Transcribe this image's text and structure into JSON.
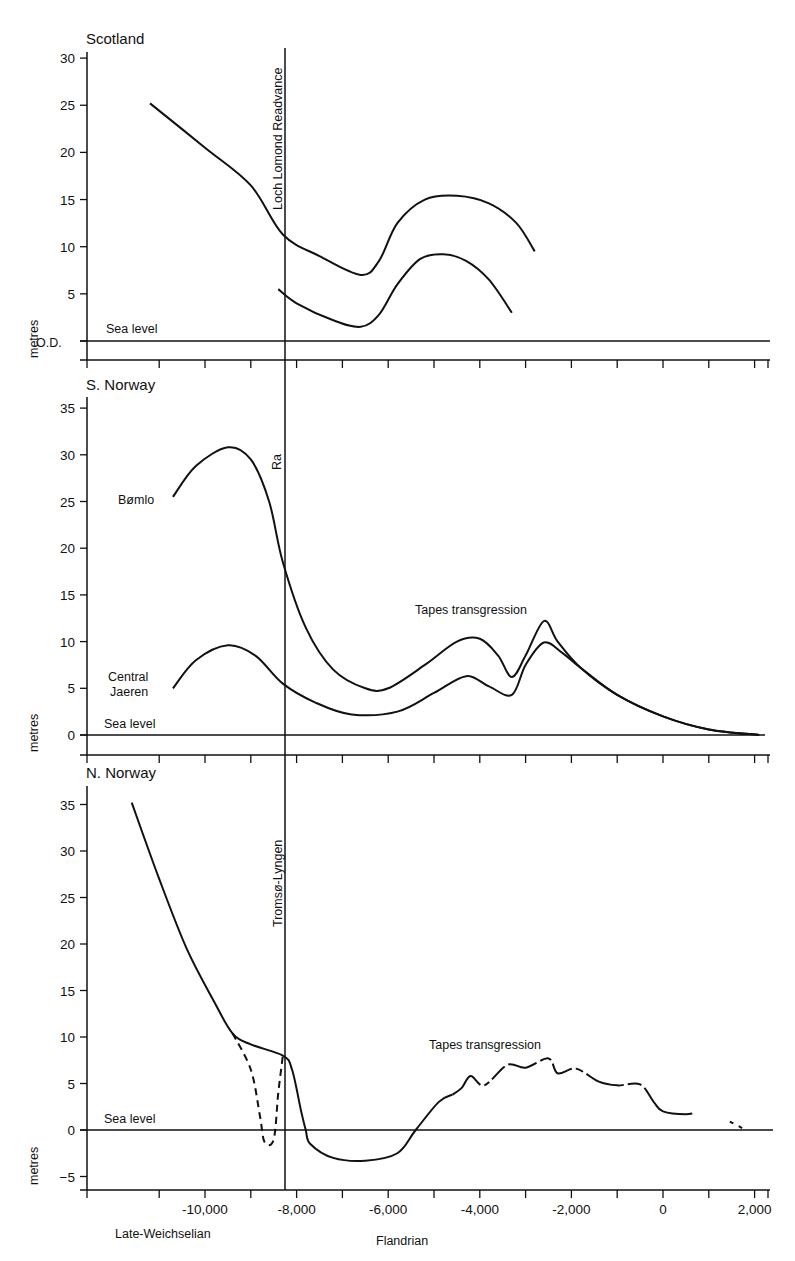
{
  "chart_data": [
    {
      "type": "line",
      "title": "Scotland",
      "ylabel": "metres",
      "ylim": [
        -2,
        31
      ],
      "yticks": [
        {
          "v": 30,
          "label": "30"
        },
        {
          "v": 25,
          "label": "25"
        },
        {
          "v": 20,
          "label": "20"
        },
        {
          "v": 15,
          "label": "15"
        },
        {
          "v": 10,
          "label": "10"
        },
        {
          "v": 5,
          "label": "5"
        },
        {
          "v": 0,
          "label": "O.D."
        }
      ],
      "baseline_label": "Sea level",
      "event_line": {
        "x": -8300,
        "label": "Loch Lomond Readvance"
      },
      "series": [
        {
          "name": "upper curve",
          "style": "solid",
          "points": [
            [
              -11200,
              25.2
            ],
            [
              -10000,
              20.5
            ],
            [
              -9000,
              16.5
            ],
            [
              -8300,
              11.3
            ],
            [
              -7500,
              9.0
            ],
            [
              -6600,
              7.0
            ],
            [
              -6200,
              8.5
            ],
            [
              -5800,
              12.5
            ],
            [
              -5200,
              15.0
            ],
            [
              -4500,
              15.4
            ],
            [
              -3800,
              14.6
            ],
            [
              -3200,
              12.5
            ],
            [
              -2800,
              9.5
            ]
          ]
        },
        {
          "name": "lower curve",
          "style": "solid",
          "points": [
            [
              -8400,
              5.5
            ],
            [
              -8000,
              4.0
            ],
            [
              -7200,
              2.2
            ],
            [
              -6600,
              1.5
            ],
            [
              -6200,
              2.8
            ],
            [
              -5800,
              6.0
            ],
            [
              -5300,
              8.7
            ],
            [
              -4800,
              9.2
            ],
            [
              -4300,
              8.5
            ],
            [
              -3800,
              6.5
            ],
            [
              -3300,
              3.0
            ]
          ]
        }
      ]
    },
    {
      "type": "line",
      "title": "S. Norway",
      "ylabel": "metres",
      "ylim": [
        -1,
        36
      ],
      "yticks": [
        {
          "v": 35,
          "label": "35"
        },
        {
          "v": 30,
          "label": "30"
        },
        {
          "v": 25,
          "label": "25"
        },
        {
          "v": 20,
          "label": "20"
        },
        {
          "v": 15,
          "label": "15"
        },
        {
          "v": 10,
          "label": "10"
        },
        {
          "v": 5,
          "label": "5"
        },
        {
          "v": 0,
          "label": "0"
        }
      ],
      "baseline_label": "Sea level",
      "event_line": {
        "x": -8300,
        "label": "Ra"
      },
      "annotation": "Tapes transgression",
      "series": [
        {
          "name": "Bømlo",
          "style": "solid",
          "points": [
            [
              -10700,
              25.5
            ],
            [
              -10200,
              28.8
            ],
            [
              -9500,
              30.8
            ],
            [
              -9000,
              29.5
            ],
            [
              -8600,
              25.0
            ],
            [
              -8300,
              18.5
            ],
            [
              -7800,
              11.5
            ],
            [
              -7200,
              7.0
            ],
            [
              -6500,
              5.0
            ],
            [
              -6000,
              5.0
            ],
            [
              -5200,
              7.5
            ],
            [
              -4500,
              10.0
            ],
            [
              -4000,
              10.3
            ],
            [
              -3600,
              8.5
            ],
            [
              -3300,
              6.2
            ],
            [
              -3000,
              8.5
            ],
            [
              -2600,
              12.2
            ],
            [
              -2300,
              10.0
            ],
            [
              -1800,
              7.2
            ],
            [
              -1000,
              4.3
            ],
            [
              0,
              2.0
            ],
            [
              1000,
              0.6
            ],
            [
              2100,
              0
            ]
          ]
        },
        {
          "name": "Central Jaeren",
          "style": "solid",
          "points": [
            [
              -10700,
              5.0
            ],
            [
              -10200,
              8.0
            ],
            [
              -9500,
              9.6
            ],
            [
              -8900,
              8.5
            ],
            [
              -8300,
              5.5
            ],
            [
              -7600,
              3.5
            ],
            [
              -6800,
              2.2
            ],
            [
              -5800,
              2.5
            ],
            [
              -5000,
              4.5
            ],
            [
              -4300,
              6.3
            ],
            [
              -3800,
              5.2
            ],
            [
              -3300,
              4.3
            ],
            [
              -3000,
              7.5
            ],
            [
              -2600,
              9.9
            ],
            [
              -2200,
              8.8
            ],
            [
              -1800,
              7.2
            ],
            [
              -1000,
              4.3
            ],
            [
              0,
              2.0
            ],
            [
              1000,
              0.6
            ],
            [
              2100,
              0
            ]
          ]
        }
      ]
    },
    {
      "type": "line",
      "title": "N. Norway",
      "ylabel": "metres",
      "ylim": [
        -6,
        37
      ],
      "yticks": [
        {
          "v": 35,
          "label": "35"
        },
        {
          "v": 30,
          "label": "30"
        },
        {
          "v": 25,
          "label": "25"
        },
        {
          "v": 20,
          "label": "20"
        },
        {
          "v": 15,
          "label": "15"
        },
        {
          "v": 10,
          "label": "10"
        },
        {
          "v": 5,
          "label": "5"
        },
        {
          "v": 0,
          "label": "0"
        },
        {
          "v": -5,
          "label": "−5"
        }
      ],
      "baseline_label": "Sea level",
      "event_line": {
        "x": -8300,
        "label": "Tromsø-Lyngen"
      },
      "annotation": "Tapes transgression",
      "series": [
        {
          "name": "main curve",
          "style": "solid",
          "points": [
            [
              -11600,
              35.2
            ],
            [
              -11000,
              27.0
            ],
            [
              -10400,
              19.5
            ],
            [
              -9800,
              13.8
            ],
            [
              -9400,
              10.4
            ],
            [
              -9000,
              9.2
            ],
            [
              -8300,
              8.0
            ],
            [
              -8100,
              6.5
            ],
            [
              -7900,
              2.0
            ],
            [
              -7800,
              0
            ],
            [
              -7700,
              -1.5
            ],
            [
              -7200,
              -3.0
            ],
            [
              -6500,
              -3.3
            ],
            [
              -5800,
              -2.5
            ],
            [
              -5400,
              0
            ],
            [
              -4900,
              3.0
            ],
            [
              -4600,
              3.8
            ]
          ]
        },
        {
          "name": "dashed dip",
          "style": "dashed",
          "points": [
            [
              -9400,
              10.4
            ],
            [
              -9000,
              6.5
            ],
            [
              -8800,
              1.5
            ],
            [
              -8700,
              -1.3
            ],
            [
              -8500,
              -1.0
            ],
            [
              -8400,
              4.0
            ],
            [
              -8300,
              8.0
            ]
          ]
        },
        {
          "name": "Tapes segment",
          "style": "mixed",
          "points": [
            [
              -4600,
              3.8
            ],
            [
              -4400,
              4.5
            ],
            [
              -4200,
              5.8
            ],
            [
              -3900,
              4.8
            ],
            [
              -3400,
              7.0
            ],
            [
              -3000,
              6.7
            ],
            [
              -2500,
              7.7
            ],
            [
              -2300,
              6.1
            ],
            [
              -1900,
              6.6
            ],
            [
              -1400,
              5.2
            ],
            [
              -1000,
              4.8
            ],
            [
              -500,
              4.9
            ],
            [
              -200,
              3.0
            ],
            [
              0,
              2.0
            ],
            [
              500,
              1.7
            ],
            [
              1000,
              2.0
            ],
            [
              1500,
              0.8
            ],
            [
              1800,
              0
            ]
          ]
        }
      ]
    }
  ],
  "x_axis": {
    "range": [
      -12600,
      2300
    ],
    "ticks": [
      {
        "v": -10000,
        "label": "-10,000"
      },
      {
        "v": -8000,
        "label": "-8,000"
      },
      {
        "v": -6000,
        "label": "-6,000"
      },
      {
        "v": -4000,
        "label": "-4,000"
      },
      {
        "v": -2000,
        "label": "-2,000"
      },
      {
        "v": 0,
        "label": "0"
      },
      {
        "v": 2000,
        "label": "2,000"
      }
    ],
    "minor_ticks": [
      -11000,
      -9000,
      -7000,
      -5000,
      -3000,
      -1000,
      1000
    ],
    "period_labels": {
      "left": "Late-Weichselian",
      "right": "Flandrian"
    }
  },
  "labels": {
    "scotland_title": "Scotland",
    "snorway_title": "S. Norway",
    "nnorway_title": "N. Norway",
    "sea_level": "Sea level",
    "metres": "metres",
    "od": "O.D.",
    "loch_lomond": "Loch Lomond Readvance",
    "ra": "Ra",
    "tromso": "Tromsø-Lyngen",
    "bomlo": "Bømlo",
    "central": "Central",
    "jaeren": "Jaeren",
    "tapes": "Tapes transgression",
    "late_weichselian": "Late-Weichselian",
    "flandrian": "Flandrian"
  }
}
